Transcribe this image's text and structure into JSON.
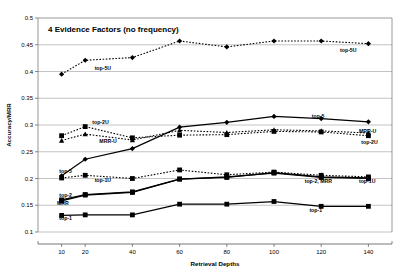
{
  "chart_data": {
    "type": "line",
    "title": "4 Evidence Factors (no frequency)",
    "xlabel": "Retrieval Depths",
    "ylabel": "Accuracy/MRR",
    "x": [
      10,
      20,
      40,
      60,
      80,
      100,
      120,
      140
    ],
    "xticklabels": [
      "10",
      "20",
      "40",
      "60",
      "80",
      "100",
      "120",
      "140"
    ],
    "ylim": [
      0.1,
      0.5
    ],
    "yticks": [
      0.1,
      0.15,
      0.2,
      0.25,
      0.3,
      0.35,
      0.4,
      0.45,
      0.5
    ],
    "yticklabels": [
      "0.1",
      "0.15",
      "0.2",
      "0.25",
      "0.3",
      "0.35",
      "0.4",
      "0.45",
      "0.5"
    ],
    "grid": true,
    "legend": "inline-annotations",
    "series": [
      {
        "name": "top-5U",
        "style": "dotted",
        "marker": "diamond",
        "values": [
          0.395,
          0.421,
          0.426,
          0.457,
          0.446,
          0.457,
          0.457,
          0.452
        ]
      },
      {
        "name": "top-5",
        "style": "solid",
        "marker": "diamond",
        "values": [
          0.205,
          0.236,
          0.256,
          0.296,
          0.305,
          0.316,
          0.312,
          0.306
        ]
      },
      {
        "name": "top-2U",
        "style": "dotted",
        "marker": "square",
        "values": [
          0.28,
          0.297,
          0.276,
          0.281,
          0.282,
          0.288,
          0.287,
          0.28
        ]
      },
      {
        "name": "MRR-U",
        "style": "dotted",
        "marker": "triangle",
        "values": [
          0.271,
          0.283,
          0.272,
          0.29,
          0.286,
          0.291,
          0.289,
          0.285
        ]
      },
      {
        "name": "top-1U",
        "style": "dotted",
        "marker": "square",
        "values": [
          0.201,
          0.206,
          0.2,
          0.216,
          0.207,
          0.212,
          0.206,
          0.203
        ]
      },
      {
        "name": "top-2",
        "style": "solid",
        "marker": "square",
        "values": [
          0.16,
          0.17,
          0.175,
          0.199,
          0.202,
          0.211,
          0.203,
          0.201
        ]
      },
      {
        "name": "MRR",
        "style": "solid",
        "marker": "square",
        "values": [
          0.158,
          0.169,
          0.174,
          0.199,
          0.203,
          0.21,
          0.202,
          0.2
        ]
      },
      {
        "name": "top-1",
        "style": "solid",
        "marker": "square",
        "values": [
          0.131,
          0.132,
          0.132,
          0.152,
          0.152,
          0.157,
          0.148,
          0.148
        ]
      }
    ],
    "annotations": [
      {
        "text": "top-5U",
        "x": 24,
        "y": 0.403,
        "name": "annotation-top5u-left"
      },
      {
        "text": "top-5U",
        "x": 128,
        "y": 0.437,
        "name": "annotation-top5u-right"
      },
      {
        "text": "top-5",
        "x": 116,
        "y": 0.314,
        "name": "annotation-top5-right"
      },
      {
        "text": "top-2U",
        "x": 23,
        "y": 0.301,
        "name": "annotation-top2u-left"
      },
      {
        "text": "MRR-U",
        "x": 26,
        "y": 0.2655,
        "name": "annotation-mrru-left"
      },
      {
        "text": "MRR-U",
        "x": 136,
        "y": 0.2855,
        "name": "annotation-mrru-right"
      },
      {
        "text": "top-2U",
        "x": 137,
        "y": 0.2645,
        "name": "annotation-top2u-right"
      },
      {
        "text": "top-5",
        "x": 9,
        "y": 0.2105,
        "name": "annotation-top5-left"
      },
      {
        "text": "top-1U",
        "x": 24,
        "y": 0.1935,
        "name": "annotation-top1u-left"
      },
      {
        "text": "top-1U",
        "x": 136,
        "y": 0.1925,
        "name": "annotation-top1u-right"
      },
      {
        "text": "top-2, MRR",
        "x": 113,
        "y": 0.1925,
        "name": "annotation-top2-mrr-right"
      },
      {
        "text": "top-2",
        "x": 9,
        "y": 0.1655,
        "name": "annotation-top2-left"
      },
      {
        "text": "MRR",
        "x": 8,
        "y": 0.1505,
        "name": "annotation-mrr-left"
      },
      {
        "text": "top-1",
        "x": 9,
        "y": 0.1215,
        "name": "annotation-top1-left"
      },
      {
        "text": "top-1",
        "x": 115,
        "y": 0.1375,
        "name": "annotation-top1-right"
      }
    ]
  }
}
